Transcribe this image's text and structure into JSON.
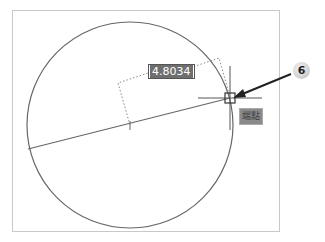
{
  "drawing": {
    "dimension_value": "4.8034",
    "snap_tooltip": "端點",
    "callout_number": "6"
  },
  "colors": {
    "geometry": "#555555",
    "dimension_box_bg": "#6f6f6f",
    "tooltip_bg": "#8a8a8a",
    "frame_border": "#c8c8c8"
  }
}
